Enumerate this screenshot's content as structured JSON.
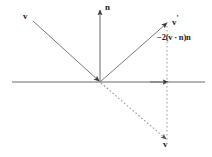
{
  "figure": {
    "type": "vector-reflection-diagram",
    "background_color": "#ffffff",
    "line_color": "#555555",
    "dashed_color": "#999999",
    "text_color": "#1a1a1a",
    "labels": {
      "incident_vector": "v",
      "normal_vector": "n",
      "reflected_vector": "v",
      "reflected_prime": "'",
      "mirrored_vector": "v",
      "projection_formula": "−2(v · n)n"
    },
    "geometry": {
      "origin": {
        "x": 100,
        "y": 82
      },
      "horizontal_axis": {
        "x1": 12,
        "y1": 82,
        "x2": 205,
        "y2": 82
      },
      "normal_axis": {
        "x1": 100,
        "y1": 82,
        "x2": 100,
        "y2": 8
      },
      "incident": {
        "x1": 33,
        "y1": 21,
        "x2": 100,
        "y2": 82
      },
      "reflected": {
        "x1": 100,
        "y1": 82,
        "x2": 167,
        "y2": 22
      },
      "continuation_dashed": {
        "x1": 100,
        "y1": 82,
        "x2": 167,
        "y2": 140
      },
      "vertical_dashed": {
        "x1": 167,
        "y1": 22,
        "x2": 167,
        "y2": 140
      },
      "axis_arrow": {
        "x": 167,
        "y": 82
      }
    }
  }
}
